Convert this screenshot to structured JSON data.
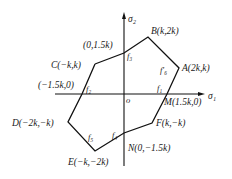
{
  "diagram": {
    "type": "yield-locus-hexagon",
    "axes": {
      "horizontal": "σ₁",
      "vertical": "σ₂",
      "origin": "o"
    },
    "vertices": [
      {
        "id": "B",
        "label": "B(k,2k)"
      },
      {
        "id": "A",
        "label": "A(2k,k)"
      },
      {
        "id": "M",
        "label": "M(1.5k,0)"
      },
      {
        "id": "F",
        "label": "F(k,−k)"
      },
      {
        "id": "N",
        "label": "N(0,−1.5k)"
      },
      {
        "id": "E",
        "label": "E(−k,−2k)"
      },
      {
        "id": "D",
        "label": "D(−2k,−k)"
      },
      {
        "id": "C",
        "label": "C(−k,k)"
      }
    ],
    "axis_intercepts": [
      {
        "id": "top",
        "label": "(0,1.5k)"
      },
      {
        "id": "left",
        "label": "(−1.5k,0)"
      }
    ],
    "segment_labels": {
      "f1": "f₁",
      "f2": "f₂",
      "f3": "f₃",
      "f4": "f₄",
      "f5": "f₅",
      "f6p": "f′₆"
    },
    "colors": {
      "line": "#111111",
      "background": "#ffffff"
    }
  }
}
